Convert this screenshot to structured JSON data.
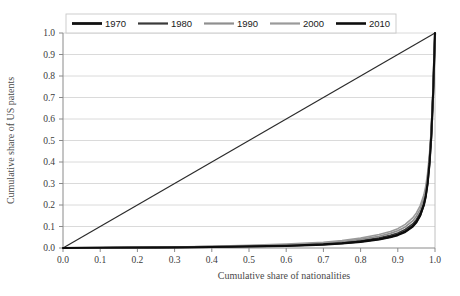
{
  "chart_data": {
    "type": "line",
    "title": "",
    "xlabel": "Cumulative share of nationalities",
    "ylabel": "Cumulative share of US patents",
    "xlim": [
      0.0,
      1.0
    ],
    "ylim": [
      0.0,
      1.0
    ],
    "xticks": [
      "0.0",
      "0.1",
      "0.2",
      "0.3",
      "0.4",
      "0.5",
      "0.6",
      "0.7",
      "0.8",
      "0.9",
      "1.0"
    ],
    "yticks": [
      "0.0",
      "0.1",
      "0.2",
      "0.3",
      "0.4",
      "0.5",
      "0.6",
      "0.7",
      "0.8",
      "0.9",
      "1.0"
    ],
    "grid": "horizontal",
    "legend_position": "top-center",
    "legend_entries": [
      "1970",
      "1980",
      "1990",
      "2000",
      "2010"
    ],
    "series": [
      {
        "name": "1970",
        "color": "#111111",
        "width": 2.2,
        "x": [
          0.0,
          0.1,
          0.2,
          0.3,
          0.4,
          0.5,
          0.6,
          0.7,
          0.75,
          0.8,
          0.85,
          0.88,
          0.9,
          0.92,
          0.94,
          0.95,
          0.96,
          0.97,
          0.975,
          0.98,
          0.985,
          0.99,
          0.995,
          1.0
        ],
        "y": [
          0.0,
          0.001,
          0.002,
          0.003,
          0.005,
          0.007,
          0.01,
          0.016,
          0.021,
          0.028,
          0.04,
          0.05,
          0.06,
          0.075,
          0.1,
          0.12,
          0.15,
          0.2,
          0.24,
          0.3,
          0.39,
          0.52,
          0.72,
          1.0
        ]
      },
      {
        "name": "1980",
        "color": "#3a3a3a",
        "width": 1.6,
        "x": [
          0.0,
          0.1,
          0.2,
          0.3,
          0.4,
          0.5,
          0.6,
          0.7,
          0.75,
          0.8,
          0.85,
          0.88,
          0.9,
          0.92,
          0.94,
          0.95,
          0.96,
          0.97,
          0.975,
          0.98,
          0.985,
          0.99,
          0.995,
          1.0
        ],
        "y": [
          0.0,
          0.001,
          0.002,
          0.004,
          0.006,
          0.009,
          0.013,
          0.02,
          0.026,
          0.035,
          0.048,
          0.059,
          0.07,
          0.086,
          0.112,
          0.133,
          0.163,
          0.212,
          0.252,
          0.312,
          0.4,
          0.528,
          0.725,
          1.0
        ]
      },
      {
        "name": "1990",
        "color": "#8f8f8f",
        "width": 1.6,
        "x": [
          0.0,
          0.1,
          0.2,
          0.3,
          0.4,
          0.5,
          0.6,
          0.7,
          0.75,
          0.8,
          0.85,
          0.88,
          0.9,
          0.92,
          0.94,
          0.95,
          0.96,
          0.97,
          0.975,
          0.98,
          0.985,
          0.99,
          0.995,
          1.0
        ],
        "y": [
          0.0,
          0.001,
          0.002,
          0.004,
          0.007,
          0.01,
          0.015,
          0.023,
          0.03,
          0.04,
          0.055,
          0.068,
          0.08,
          0.098,
          0.126,
          0.148,
          0.18,
          0.23,
          0.27,
          0.33,
          0.418,
          0.542,
          0.732,
          1.0
        ]
      },
      {
        "name": "2000",
        "color": "#9a9a9a",
        "width": 1.6,
        "x": [
          0.0,
          0.1,
          0.2,
          0.3,
          0.4,
          0.5,
          0.6,
          0.7,
          0.75,
          0.8,
          0.85,
          0.88,
          0.9,
          0.92,
          0.94,
          0.95,
          0.96,
          0.97,
          0.975,
          0.98,
          0.985,
          0.99,
          0.995,
          1.0
        ],
        "y": [
          0.0,
          0.001,
          0.003,
          0.005,
          0.008,
          0.012,
          0.018,
          0.027,
          0.035,
          0.046,
          0.063,
          0.077,
          0.09,
          0.11,
          0.14,
          0.163,
          0.196,
          0.246,
          0.286,
          0.346,
          0.432,
          0.552,
          0.738,
          1.0
        ]
      },
      {
        "name": "2010",
        "color": "#0d0d0d",
        "width": 2.0,
        "x": [
          0.0,
          0.1,
          0.2,
          0.3,
          0.4,
          0.5,
          0.6,
          0.7,
          0.75,
          0.8,
          0.85,
          0.88,
          0.9,
          0.92,
          0.94,
          0.95,
          0.96,
          0.97,
          0.975,
          0.98,
          0.985,
          0.99,
          0.995,
          1.0
        ],
        "y": [
          0.0,
          0.001,
          0.002,
          0.003,
          0.005,
          0.008,
          0.011,
          0.017,
          0.022,
          0.03,
          0.042,
          0.052,
          0.062,
          0.077,
          0.102,
          0.122,
          0.152,
          0.202,
          0.242,
          0.302,
          0.392,
          0.522,
          0.722,
          1.0
        ]
      }
    ],
    "reference_line": {
      "name": "line-of-equality",
      "color": "#2b2b2b",
      "width": 1.2,
      "x": [
        0.0,
        1.0
      ],
      "y": [
        0.0,
        1.0
      ]
    }
  }
}
